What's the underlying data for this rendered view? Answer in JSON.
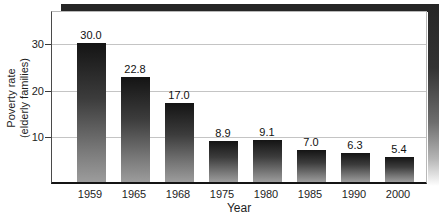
{
  "figure": {
    "y_axis_title_line1": "Poverty rate",
    "y_axis_title_line2": "(elderly families)",
    "x_axis_title": "Year"
  },
  "chart_data": {
    "type": "bar",
    "categories": [
      "1959",
      "1965",
      "1968",
      "1975",
      "1980",
      "1985",
      "1990",
      "2000"
    ],
    "values": [
      30.0,
      22.8,
      17.0,
      8.9,
      9.1,
      7.0,
      6.3,
      5.4
    ],
    "value_labels": [
      "30.0",
      "22.8",
      "17.0",
      "8.9",
      "9.1",
      "7.0",
      "6.3",
      "5.4"
    ],
    "title": "",
    "xlabel": "Year",
    "ylabel": "Poverty rate (elderly families)",
    "y_ticks": [
      10,
      20,
      30
    ],
    "ylim": [
      0,
      37.0
    ],
    "grid": true,
    "legend": "none",
    "colors": {
      "bar_gradient_top": "#141414",
      "bar_gradient_bottom": "#9c9c9c",
      "gridline": "#c4c4c4",
      "shadow": "#262626",
      "text": "#1d1d1d",
      "background": "#ffffff"
    }
  }
}
